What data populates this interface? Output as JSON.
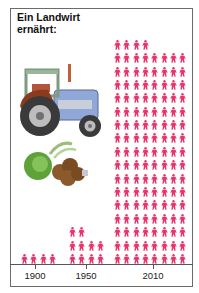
{
  "title_line1": "Ein Landwirt",
  "title_line2": "ernährt:",
  "colors": {
    "person": "#e8356b",
    "tractor_body": "#8fa8d8",
    "tractor_cab": "#9ab59a",
    "tractor_fender": "#8b3a1e",
    "frame": "#6b6b6b"
  },
  "axis": {
    "ticks": [
      {
        "label": "1900",
        "x": 35
      },
      {
        "label": "1950",
        "x": 86
      },
      {
        "label": "2010",
        "x": 153
      }
    ]
  },
  "chart_data": {
    "type": "pictogram",
    "title": "Ein Landwirt ernährt:",
    "xlabel": "",
    "ylabel": "",
    "categories": [
      "1900",
      "1950",
      "2010"
    ],
    "values": [
      4,
      10,
      132
    ],
    "unit": "Menschen (people fed per farmer)",
    "icon": "person-figure",
    "layout": {
      "1900": {
        "per_row": 4,
        "rows": 1
      },
      "1950": {
        "per_row": 4,
        "rows": 3,
        "top_row_count": 2
      },
      "2010": {
        "per_row": 8,
        "rows": 17,
        "top_row_count": 4
      }
    },
    "illustrations": [
      "tractor",
      "vegetables (cabbage, potatoes, leek)"
    ]
  }
}
